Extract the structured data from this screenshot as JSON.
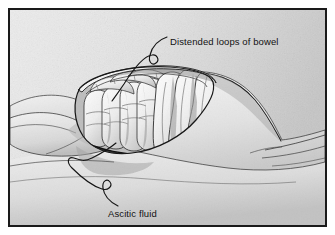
{
  "figure": {
    "domain": "medical-illustration",
    "style": "grayscale pen-and-ink line drawing with stipple shading",
    "background_color": "#e4e4e4",
    "border_color": "#1a1a1a",
    "ink_color": "#121212"
  },
  "labels": [
    {
      "id": "bowel",
      "text": "Distended loops of bowel",
      "x": 160,
      "y": 26,
      "leader": "squiggle curve descending left to the bowel loops"
    },
    {
      "id": "ascites",
      "text": "Ascitic fluid",
      "x": 98,
      "y": 198,
      "leader": "S-curve ascending right to the fluid level"
    }
  ],
  "anatomy": {
    "body": "supine torso with arm at left and thigh at right",
    "cutaway": "oval abdominal window exposing peritoneal cavity",
    "small_bowel": "row of segmented distended small bowel loops",
    "large_bowel": "three large lobed distended bowel loops",
    "fluid_level": "dark horizontal ascitic fluid band at base of cavity"
  }
}
